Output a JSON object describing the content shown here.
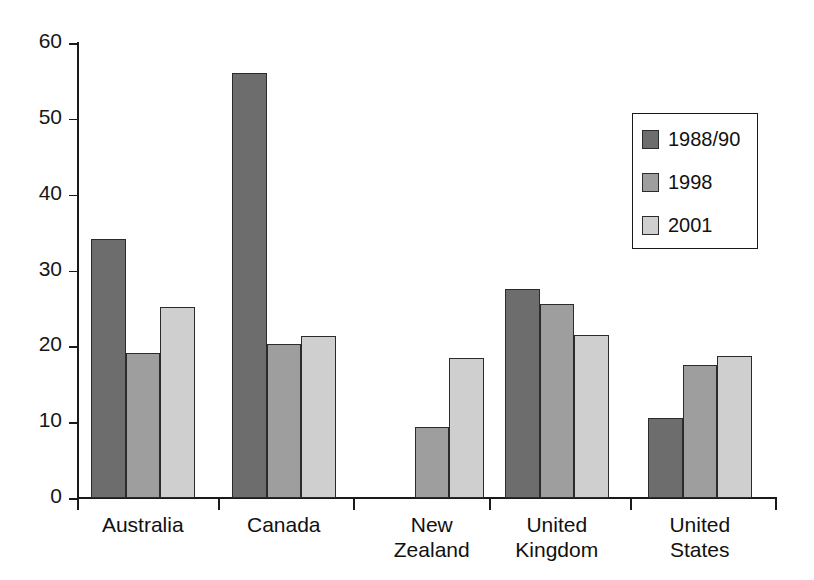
{
  "chart_data": {
    "type": "bar",
    "title": "",
    "subtitle": "",
    "xlabel": "",
    "ylabel": "",
    "ylim": [
      0,
      60
    ],
    "ytick_values": [
      0,
      10,
      20,
      30,
      40,
      50,
      60
    ],
    "ytick_labels": [
      "0",
      "10",
      "20",
      "30",
      "40",
      "50",
      "60"
    ],
    "grid": false,
    "legend_position": "upper right",
    "categories": [
      "Australia",
      "Canada",
      "New Zealand",
      "United Kingdom",
      "United States"
    ],
    "category_labels": [
      "Australia",
      "Canada",
      "New\nZealand",
      "United\nKingdom",
      "United\nStates"
    ],
    "series": [
      {
        "name": "1988/90",
        "color": "#6d6d6d",
        "values": [
          34.2,
          56.1,
          null,
          27.5,
          10.6
        ]
      },
      {
        "name": "1998",
        "color": "#9e9e9e",
        "values": [
          19.1,
          20.3,
          9.4,
          25.6,
          17.5
        ]
      },
      {
        "name": "2001",
        "color": "#cfcfcf",
        "values": [
          25.2,
          21.3,
          18.5,
          21.5,
          18.7
        ]
      }
    ]
  },
  "legend": {
    "entries": [
      {
        "label": "1988/90"
      },
      {
        "label": "1998"
      },
      {
        "label": "2001"
      }
    ]
  },
  "axis": {
    "y_labels": [
      "60",
      "50",
      "40",
      "30",
      "20",
      "10",
      "0"
    ]
  }
}
